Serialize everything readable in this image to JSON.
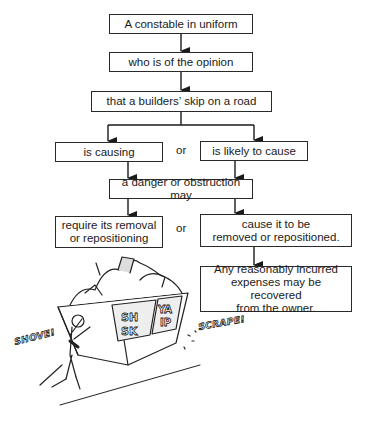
{
  "flowchart": {
    "step1": "A constable in uniform",
    "step2": "who is of the opinion",
    "step3": "that a builders’ skip on a road",
    "branch1": {
      "left": "is causing",
      "connector": "or",
      "right": "is likely to cause"
    },
    "step4": "a danger or obstruction may",
    "branch2": {
      "left_line1": "require its removal",
      "left_line2": "or repositioning",
      "connector": "or",
      "right_line1": "cause it to be",
      "right_line2": "removed or repositioned."
    },
    "step5": {
      "line1": "Any reasonably incurred",
      "line2": "expenses may be recovered",
      "line3": "from the owner."
    }
  },
  "illustration": {
    "description": "Cartoon of a man shoving an overflowing builders' skip along the road",
    "skip_label_left": "SH SK",
    "skip_label_right": "YA IP",
    "sound_left": "SHOVE!",
    "sound_right": "SCRAPE!"
  }
}
